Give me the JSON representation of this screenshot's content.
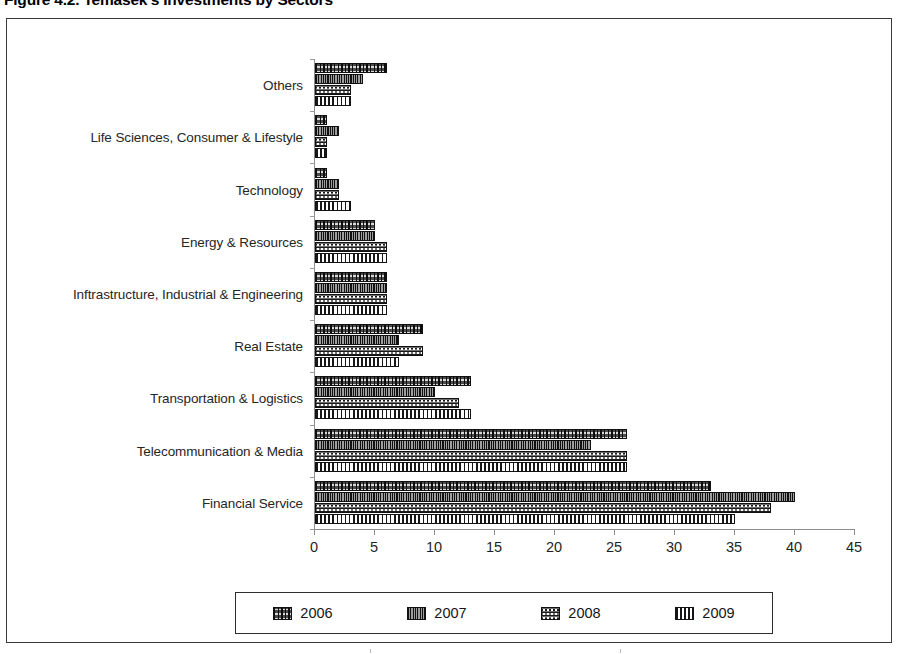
{
  "figure": {
    "title": "Figure  4.2. Temasek's Investments by Sectors"
  },
  "legend": {
    "items": [
      {
        "label": "2006",
        "swatch": "pattern-vertical-dash-dark"
      },
      {
        "label": "2007",
        "swatch": "pattern-dense-speckle"
      },
      {
        "label": "2008",
        "swatch": "pattern-dark-dots"
      },
      {
        "label": "2009",
        "swatch": "pattern-vertical-lines-white"
      }
    ]
  },
  "chart_data": {
    "type": "bar",
    "orientation": "horizontal",
    "title": "Figure  4.2. Temasek's Investments by Sectors",
    "xlabel": "",
    "ylabel": "",
    "xlim": [
      0,
      45
    ],
    "xticks": [
      0,
      5,
      10,
      15,
      20,
      25,
      30,
      35,
      40,
      45
    ],
    "grid": false,
    "legend_position": "bottom",
    "categories": [
      "Others",
      "Life Sciences, Consumer & Lifestyle",
      "Technology",
      "Energy & Resources",
      "Inftrastructure, Industrial & Engineering",
      "Real Estate",
      "Transportation & Logistics",
      "Telecommunication & Media",
      "Financial Service"
    ],
    "series": [
      {
        "name": "2006",
        "values": [
          6,
          1,
          1,
          5,
          6,
          9,
          13,
          26,
          33
        ]
      },
      {
        "name": "2007",
        "values": [
          4,
          2,
          2,
          5,
          6,
          7,
          10,
          23,
          40
        ]
      },
      {
        "name": "2008",
        "values": [
          3,
          1,
          2,
          6,
          6,
          9,
          12,
          26,
          38
        ]
      },
      {
        "name": "2009",
        "values": [
          3,
          1,
          3,
          6,
          6,
          7,
          13,
          26,
          35
        ]
      }
    ]
  }
}
